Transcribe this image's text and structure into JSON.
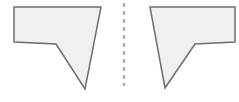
{
  "diagram": {
    "colors": {
      "fill": "#f0f0f0",
      "stroke": "#6e6e6e",
      "axis": "#8a8a8a",
      "background": "#ffffff"
    },
    "left_shape": {
      "points": "14,7 101,7 85,89 56,44 14,42"
    },
    "mirror_line": {
      "x": 124,
      "y1": 3,
      "y2": 86,
      "dash": "4,4"
    },
    "right_shape": {
      "points": "150,7 235,7 235,42 195,44 165,88"
    }
  }
}
